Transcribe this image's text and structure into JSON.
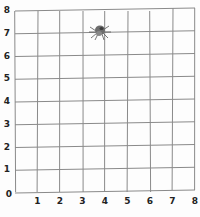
{
  "grid": {
    "cols": 8,
    "rows": 8,
    "x_labels": [
      "0",
      "1",
      "2",
      "3",
      "4",
      "5",
      "6",
      "7",
      "8"
    ],
    "y_labels": [
      "0",
      "1",
      "2",
      "3",
      "4",
      "5",
      "6",
      "7",
      "8"
    ],
    "line_color": "#8a8a8a"
  },
  "marker": {
    "name": "spider",
    "x": 4,
    "y": 7
  }
}
